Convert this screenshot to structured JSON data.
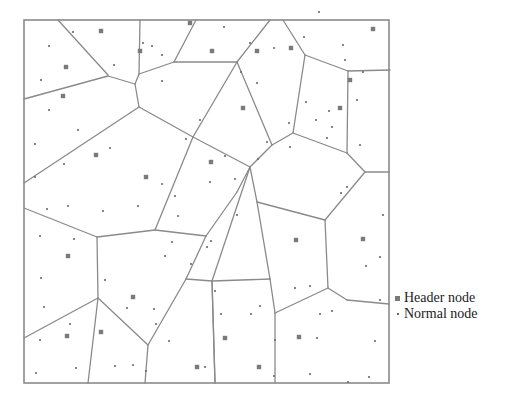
{
  "figure": {
    "type": "voronoi-partition",
    "frame": {
      "x1": 24,
      "y1": 20,
      "x2": 389,
      "y2": 383
    },
    "colors": {
      "edge": "#8a8a8a",
      "header_node": "#7a7a7a",
      "normal_node": "#6a6a6a",
      "background": "#ffffff"
    }
  },
  "legend": {
    "items": [
      {
        "label": "Header node",
        "marker": "square"
      },
      {
        "label": "Normal node",
        "marker": "dot"
      }
    ]
  },
  "edges": [
    [
      58,
      20,
      108,
      75
    ],
    [
      24,
      99,
      108,
      76
    ],
    [
      108,
      76,
      135,
      84
    ],
    [
      135,
      84,
      139,
      74
    ],
    [
      140,
      20,
      139,
      74
    ],
    [
      139,
      74,
      174,
      62
    ],
    [
      196,
      20,
      174,
      62
    ],
    [
      174,
      62,
      237,
      62
    ],
    [
      270,
      20,
      237,
      62
    ],
    [
      237,
      62,
      272,
      145
    ],
    [
      237,
      62,
      193,
      137
    ],
    [
      135,
      84,
      139,
      107
    ],
    [
      139,
      107,
      24,
      183
    ],
    [
      139,
      107,
      193,
      137
    ],
    [
      283,
      20,
      305,
      55
    ],
    [
      305,
      55,
      348,
      71
    ],
    [
      348,
      71,
      390,
      70
    ],
    [
      305,
      55,
      293,
      133
    ],
    [
      293,
      133,
      347,
      153
    ],
    [
      348,
      71,
      347,
      153
    ],
    [
      272,
      145,
      293,
      133
    ],
    [
      272,
      145,
      250,
      167
    ],
    [
      250,
      167,
      193,
      137
    ],
    [
      347,
      153,
      365,
      172
    ],
    [
      365,
      172,
      389,
      172
    ],
    [
      193,
      137,
      155,
      230
    ],
    [
      250,
      167,
      237,
      192
    ],
    [
      237,
      192,
      206,
      236
    ],
    [
      206,
      236,
      155,
      230
    ],
    [
      155,
      230,
      97,
      237
    ],
    [
      24,
      208,
      97,
      237
    ],
    [
      97,
      237,
      98,
      298
    ],
    [
      98,
      298,
      24,
      338
    ],
    [
      98,
      298,
      88,
      383
    ],
    [
      98,
      298,
      148,
      345
    ],
    [
      148,
      345,
      145,
      383
    ],
    [
      148,
      345,
      186,
      279
    ],
    [
      186,
      279,
      206,
      236
    ],
    [
      186,
      279,
      212,
      281
    ],
    [
      212,
      281,
      250,
      167
    ],
    [
      212,
      281,
      270,
      279
    ],
    [
      270,
      279,
      257,
      202
    ],
    [
      257,
      202,
      250,
      167
    ],
    [
      257,
      202,
      325,
      220
    ],
    [
      325,
      220,
      365,
      172
    ],
    [
      270,
      279,
      275,
      313
    ],
    [
      275,
      313,
      275,
      383
    ],
    [
      275,
      313,
      328,
      288
    ],
    [
      328,
      288,
      347,
      300
    ],
    [
      347,
      300,
      389,
      304
    ],
    [
      325,
      220,
      328,
      288
    ],
    [
      212,
      281,
      215,
      383
    ],
    [
      215,
      383,
      212,
      281
    ]
  ],
  "header_nodes": [
    [
      101,
      31
    ],
    [
      66,
      67
    ],
    [
      63,
      96
    ],
    [
      140,
      51
    ],
    [
      212,
      51
    ],
    [
      190,
      23
    ],
    [
      257,
      51
    ],
    [
      291,
      48
    ],
    [
      373,
      29
    ],
    [
      350,
      80
    ],
    [
      340,
      108
    ],
    [
      146,
      177
    ],
    [
      96,
      155
    ],
    [
      211,
      162
    ],
    [
      243,
      108
    ],
    [
      296,
      240
    ],
    [
      363,
      239
    ],
    [
      68,
      256
    ],
    [
      101,
      332
    ],
    [
      67,
      336
    ],
    [
      133,
      297
    ],
    [
      197,
      367
    ],
    [
      225,
      338
    ],
    [
      299,
      337
    ],
    [
      259,
      367
    ]
  ],
  "normal_nodes": [
    [
      73,
      32
    ],
    [
      49,
      46
    ],
    [
      41,
      80
    ],
    [
      114,
      65
    ],
    [
      143,
      43
    ],
    [
      162,
      55
    ],
    [
      162,
      81
    ],
    [
      152,
      46
    ],
    [
      224,
      27
    ],
    [
      241,
      72
    ],
    [
      250,
      43
    ],
    [
      274,
      48
    ],
    [
      304,
      37
    ],
    [
      319,
      12
    ],
    [
      343,
      45
    ],
    [
      345,
      60
    ],
    [
      363,
      72
    ],
    [
      357,
      100
    ],
    [
      360,
      145
    ],
    [
      332,
      127
    ],
    [
      316,
      120
    ],
    [
      257,
      83
    ],
    [
      267,
      142
    ],
    [
      290,
      147
    ],
    [
      306,
      102
    ],
    [
      329,
      111
    ],
    [
      327,
      138
    ],
    [
      49,
      110
    ],
    [
      78,
      130
    ],
    [
      35,
      144
    ],
    [
      110,
      148
    ],
    [
      64,
      164
    ],
    [
      35,
      177
    ],
    [
      47,
      209
    ],
    [
      68,
      206
    ],
    [
      103,
      211
    ],
    [
      138,
      206
    ],
    [
      175,
      196
    ],
    [
      178,
      216
    ],
    [
      211,
      241
    ],
    [
      210,
      182
    ],
    [
      235,
      179
    ],
    [
      258,
      159
    ],
    [
      289,
      123
    ],
    [
      200,
      120
    ],
    [
      225,
      156
    ],
    [
      186,
      139
    ],
    [
      162,
      184
    ],
    [
      40,
      236
    ],
    [
      74,
      239
    ],
    [
      41,
      278
    ],
    [
      44,
      307
    ],
    [
      70,
      324
    ],
    [
      40,
      340
    ],
    [
      76,
      368
    ],
    [
      36,
      373
    ],
    [
      105,
      280
    ],
    [
      127,
      308
    ],
    [
      115,
      366
    ],
    [
      133,
      365
    ],
    [
      154,
      309
    ],
    [
      165,
      256
    ],
    [
      172,
      242
    ],
    [
      191,
      264
    ],
    [
      215,
      291
    ],
    [
      221,
      314
    ],
    [
      251,
      314
    ],
    [
      260,
      306
    ],
    [
      275,
      340
    ],
    [
      274,
      376
    ],
    [
      295,
      288
    ],
    [
      310,
      286
    ],
    [
      310,
      374
    ],
    [
      320,
      314
    ],
    [
      317,
      338
    ],
    [
      332,
      311
    ],
    [
      366,
      266
    ],
    [
      375,
      341
    ],
    [
      348,
      382
    ],
    [
      369,
      377
    ],
    [
      380,
      300
    ],
    [
      380,
      257
    ],
    [
      383,
      215
    ],
    [
      347,
      187
    ],
    [
      341,
      193
    ],
    [
      237,
      215
    ],
    [
      207,
      247
    ],
    [
      205,
      367
    ],
    [
      156,
      324
    ],
    [
      169,
      341
    ],
    [
      146,
      371
    ]
  ]
}
